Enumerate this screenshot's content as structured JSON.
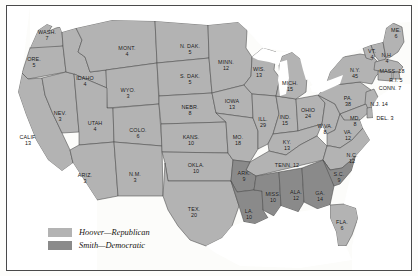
{
  "figure": {
    "background_color": "#fcfcfa",
    "frame_color": "#4a4a4a"
  },
  "colors": {
    "republican_fill": "#b3b3b3",
    "democratic_fill": "#8a8a8a",
    "border": "#4a4a4a",
    "label_text": "#121212",
    "water": "#ffffff"
  },
  "legend": {
    "position": "bottom-left",
    "items": [
      {
        "swatch": "republican-swatch",
        "label": "Hoover—Republican",
        "color": "#b3b3b3"
      },
      {
        "swatch": "democratic-swatch",
        "label": "Smith—Democratic",
        "color": "#8a8a8a"
      }
    ]
  },
  "chart_data": {
    "type": "map",
    "value_label": "Electoral Votes",
    "categories": [
      "Hoover—Republican",
      "Smith—Democratic"
    ],
    "states": [
      {
        "abbr": "WASH.",
        "votes": "7",
        "party": "republican",
        "x": 47,
        "y": 35,
        "layout": "stack"
      },
      {
        "abbr": "ORE.",
        "votes": "5",
        "party": "republican",
        "x": 34,
        "y": 62,
        "layout": "stack"
      },
      {
        "abbr": "IDAHO",
        "votes": "4",
        "party": "republican",
        "x": 85,
        "y": 81,
        "layout": "stack"
      },
      {
        "abbr": "MONT.",
        "votes": "4",
        "party": "republican",
        "x": 127,
        "y": 51,
        "layout": "stack"
      },
      {
        "abbr": "WYO.",
        "votes": "3",
        "party": "republican",
        "x": 128,
        "y": 93,
        "layout": "stack"
      },
      {
        "abbr": "NEV.",
        "votes": "3",
        "party": "republican",
        "x": 60,
        "y": 116,
        "layout": "stack"
      },
      {
        "abbr": "UTAH",
        "votes": "4",
        "party": "republican",
        "x": 95,
        "y": 126,
        "layout": "stack"
      },
      {
        "abbr": "COLO.",
        "votes": "6",
        "party": "republican",
        "x": 138,
        "y": 133,
        "layout": "stack"
      },
      {
        "abbr": "CALIF.",
        "votes": "13",
        "party": "republican",
        "x": 28,
        "y": 140,
        "layout": "stack"
      },
      {
        "abbr": "ARIZ.",
        "votes": "3",
        "party": "republican",
        "x": 85,
        "y": 178,
        "layout": "stack"
      },
      {
        "abbr": "N.M.",
        "votes": "3",
        "party": "republican",
        "x": 135,
        "y": 177,
        "layout": "stack"
      },
      {
        "abbr": "N. DAK.",
        "votes": "5",
        "party": "republican",
        "x": 190,
        "y": 49,
        "layout": "stack"
      },
      {
        "abbr": "S. DAK.",
        "votes": "5",
        "party": "republican",
        "x": 190,
        "y": 79,
        "layout": "stack"
      },
      {
        "abbr": "NEBR.",
        "votes": "8",
        "party": "republican",
        "x": 190,
        "y": 110,
        "layout": "stack"
      },
      {
        "abbr": "KANS.",
        "votes": "10",
        "party": "republican",
        "x": 191,
        "y": 140,
        "layout": "stack"
      },
      {
        "abbr": "OKLA.",
        "votes": "10",
        "party": "republican",
        "x": 196,
        "y": 168,
        "layout": "stack"
      },
      {
        "abbr": "TEX.",
        "votes": "20",
        "party": "republican",
        "x": 194,
        "y": 212,
        "layout": "stack"
      },
      {
        "abbr": "MINN.",
        "votes": "12",
        "party": "republican",
        "x": 226,
        "y": 65,
        "layout": "stack"
      },
      {
        "abbr": "IOWA",
        "votes": "13",
        "party": "republican",
        "x": 232,
        "y": 104,
        "layout": "stack"
      },
      {
        "abbr": "MO.",
        "votes": "18",
        "party": "republican",
        "x": 238,
        "y": 140,
        "layout": "stack"
      },
      {
        "abbr": "WIS.",
        "votes": "13",
        "party": "republican",
        "x": 259,
        "y": 72,
        "layout": "stack"
      },
      {
        "abbr": "ILL.",
        "votes": "29",
        "party": "republican",
        "x": 263,
        "y": 122,
        "layout": "stack"
      },
      {
        "abbr": "IND.",
        "votes": "15",
        "party": "republican",
        "x": 285,
        "y": 120,
        "layout": "stack"
      },
      {
        "abbr": "MICH.",
        "votes": "15",
        "party": "republican",
        "x": 290,
        "y": 86,
        "layout": "stack"
      },
      {
        "abbr": "OHIO",
        "votes": "24",
        "party": "republican",
        "x": 308,
        "y": 113,
        "layout": "stack"
      },
      {
        "abbr": "KY.",
        "votes": "13",
        "party": "republican",
        "x": 287,
        "y": 145,
        "layout": "stack"
      },
      {
        "abbr": "TENN.",
        "votes": "12",
        "party": "republican",
        "x": 287,
        "y": 165,
        "layout": "inline"
      },
      {
        "abbr": "W.VA.",
        "votes": "8",
        "party": "republican",
        "x": 325,
        "y": 129,
        "layout": "stack"
      },
      {
        "abbr": "VA.",
        "votes": "12",
        "party": "republican",
        "x": 348,
        "y": 135,
        "layout": "stack"
      },
      {
        "abbr": "N.C.",
        "votes": "12",
        "party": "republican",
        "x": 352,
        "y": 158,
        "layout": "stack"
      },
      {
        "abbr": "FLA.",
        "votes": "6",
        "party": "republican",
        "x": 342,
        "y": 225,
        "layout": "stack"
      },
      {
        "abbr": "PA.",
        "votes": "38",
        "party": "republican",
        "x": 348,
        "y": 101,
        "layout": "stack"
      },
      {
        "abbr": "N.Y.",
        "votes": "45",
        "party": "republican",
        "x": 355,
        "y": 73,
        "layout": "stack"
      },
      {
        "abbr": "ME.",
        "votes": "6",
        "party": "republican",
        "x": 396,
        "y": 33,
        "layout": "stack"
      },
      {
        "abbr": "VT.",
        "votes": "4",
        "party": "republican",
        "x": 372,
        "y": 54,
        "layout": "stack"
      },
      {
        "abbr": "N.H.",
        "votes": "4",
        "party": "republican",
        "x": 387,
        "y": 58,
        "layout": "stack"
      },
      {
        "abbr": "MASS.",
        "votes": "18",
        "party": "republican",
        "x": 392,
        "y": 71,
        "layout": "mass"
      },
      {
        "abbr": "R.I.",
        "votes": "5",
        "party": "republican",
        "x": 396,
        "y": 80,
        "layout": "inline"
      },
      {
        "abbr": "CONN.",
        "votes": "7",
        "party": "republican",
        "x": 390,
        "y": 88,
        "layout": "inline"
      },
      {
        "abbr": "N.J.",
        "votes": "14",
        "party": "republican",
        "x": 379,
        "y": 104,
        "layout": "inline"
      },
      {
        "abbr": "MD.",
        "votes": "8",
        "party": "republican",
        "x": 355,
        "y": 121,
        "layout": "stack"
      },
      {
        "abbr": "DEL.",
        "votes": "3",
        "party": "republican",
        "x": 385,
        "y": 118,
        "layout": "inline"
      },
      {
        "abbr": "ARK.",
        "votes": "9",
        "party": "democratic",
        "x": 244,
        "y": 176,
        "layout": "stack"
      },
      {
        "abbr": "LA.",
        "votes": "10",
        "party": "democratic",
        "x": 249,
        "y": 214,
        "layout": "stack"
      },
      {
        "abbr": "MISS.",
        "votes": "10",
        "party": "democratic",
        "x": 273,
        "y": 197,
        "layout": "stack"
      },
      {
        "abbr": "ALA.",
        "votes": "12",
        "party": "democratic",
        "x": 296,
        "y": 195,
        "layout": "stack"
      },
      {
        "abbr": "GA.",
        "votes": "14",
        "party": "democratic",
        "x": 320,
        "y": 196,
        "layout": "stack"
      },
      {
        "abbr": "S.C.",
        "votes": "9",
        "party": "democratic",
        "x": 339,
        "y": 177,
        "layout": "stack"
      }
    ]
  }
}
